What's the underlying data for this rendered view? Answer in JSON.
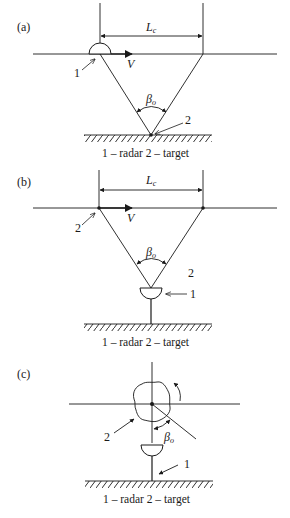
{
  "panels": [
    {
      "id": "a",
      "label": "(a)",
      "distance_label": "L",
      "distance_sub": "c",
      "velocity_label": "V",
      "angle_label": "β",
      "angle_sub": "o",
      "marker_1": "1",
      "marker_2": "2",
      "caption": "1 – radar    2 – target"
    },
    {
      "id": "b",
      "label": "(b)",
      "distance_label": "L",
      "distance_sub": "c",
      "velocity_label": "V",
      "angle_label": "β",
      "angle_sub": "o",
      "marker_1": "1",
      "marker_2": "2",
      "marker_2b": "2",
      "caption": "1 – radar    2 – target"
    },
    {
      "id": "c",
      "label": "(c)",
      "angle_label": "β",
      "angle_sub": "o",
      "marker_1": "1",
      "marker_2": "2",
      "caption": "1 – radar    2 – target"
    }
  ],
  "colors": {
    "line": "#1a1a1a",
    "background": "#ffffff"
  }
}
